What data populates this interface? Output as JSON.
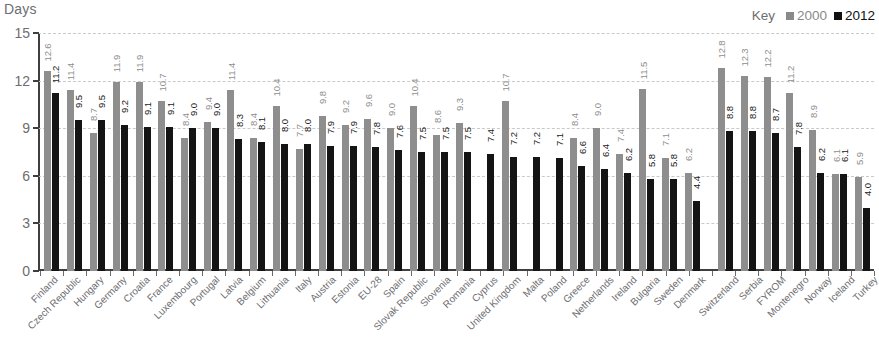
{
  "axis_title": "Days",
  "legend": {
    "key_label": "Key",
    "entries": [
      {
        "label": "2000",
        "color": "#8e8e8e"
      },
      {
        "label": "2012",
        "color": "#141414"
      }
    ]
  },
  "y_ticks": [
    "0",
    "3",
    "6",
    "9",
    "12",
    "15"
  ],
  "chart_data": {
    "type": "bar",
    "title": "",
    "subtitle": "",
    "xlabel": "",
    "ylabel": "Days",
    "ylim": [
      0,
      15
    ],
    "ytick_step": 3,
    "grid": true,
    "grid_style": "dashed-horizontal",
    "legend_position": "top-right",
    "group_separator_after_index": 28,
    "categories": [
      "Finland",
      "Czech Republic",
      "Hungary",
      "Germany",
      "Croatia",
      "France",
      "Luxembourg",
      "Portugal",
      "Latvia",
      "Belgium",
      "Lithuania",
      "Italy",
      "Austria",
      "Estonia",
      "EU-28",
      "Spain",
      "Slovak Republic",
      "Slovenia",
      "Romania",
      "Cyprus",
      "United Kingdom",
      "Malta",
      "Poland",
      "Greece",
      "Netherlands",
      "Ireland",
      "Bulgaria",
      "Sweden",
      "Denmark",
      "Switzerland",
      "Serbia",
      "FYROM",
      "Montenegro",
      "Norway",
      "Iceland",
      "Turkey"
    ],
    "series": [
      {
        "name": "2000",
        "color": "#8e8e8e",
        "values": [
          12.6,
          11.4,
          8.7,
          11.9,
          11.9,
          10.7,
          8.4,
          9.4,
          11.4,
          8.4,
          10.4,
          7.7,
          9.8,
          9.2,
          9.6,
          9.0,
          10.4,
          8.6,
          9.3,
          null,
          10.7,
          null,
          null,
          8.4,
          9.0,
          7.4,
          11.5,
          7.1,
          6.2,
          12.8,
          12.3,
          12.2,
          11.2,
          8.9,
          6.1,
          5.9
        ],
        "labels": [
          "12.6",
          "11.4",
          "8.7",
          "11.9",
          "11.9",
          "10.7",
          "8.4",
          "9.4",
          "11.4",
          "8.4",
          "10.4",
          "7.7",
          "9.8",
          "9.2",
          "9.6",
          "9.0",
          "10.4",
          "8.6",
          "9.3",
          "",
          "10.7",
          "",
          "",
          "8.4",
          "9.0",
          "7.4",
          "11.5",
          "7.1",
          "6.2",
          "12.8",
          "12.3",
          "12.2",
          "11.2",
          "8.9",
          "6.1",
          "5.9"
        ]
      },
      {
        "name": "2012",
        "color": "#141414",
        "values": [
          11.2,
          9.5,
          9.5,
          9.2,
          9.1,
          9.1,
          9.0,
          9.0,
          8.3,
          8.1,
          8.0,
          8.0,
          7.9,
          7.9,
          7.8,
          7.6,
          7.5,
          7.5,
          7.5,
          7.4,
          7.2,
          7.2,
          7.1,
          6.6,
          6.4,
          6.2,
          5.8,
          5.8,
          4.4,
          8.8,
          8.8,
          8.7,
          7.8,
          6.2,
          6.1,
          4.0
        ],
        "labels": [
          "11.2",
          "9.5",
          "9.5",
          "9.2",
          "9.1",
          "9.1",
          "9.0",
          "9.0",
          "8.3",
          "8.1",
          "8.0",
          "8.0",
          "7.9",
          "7.9",
          "7.8",
          "7.6",
          "7.5",
          "7.5",
          "7.5",
          "7.4",
          "7.2",
          "7.2",
          "7.1",
          "6.6",
          "6.4",
          "6.2",
          "5.8",
          "5.8",
          "4.4",
          "8.8",
          "8.8",
          "8.7",
          "7.8",
          "6.2",
          "6.1",
          "4.0"
        ]
      }
    ]
  }
}
